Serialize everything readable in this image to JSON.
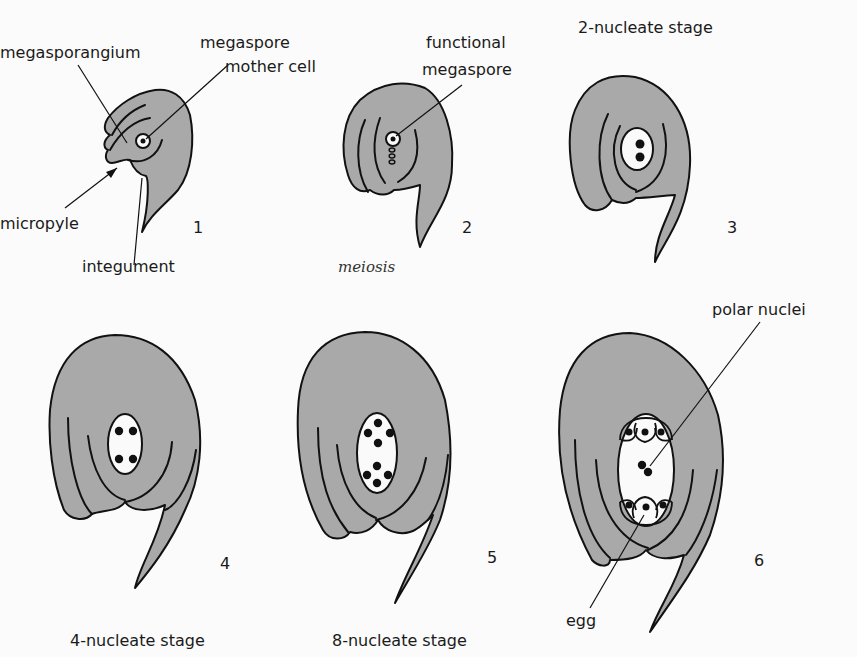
{
  "figure": {
    "colors": {
      "tissue": "#a9a9a9",
      "outline": "#111111",
      "sac": "#fafafa",
      "background": "#fbfbfb"
    },
    "panels": [
      {
        "number": "1",
        "labels": [
          "megasporangium",
          "megaspore",
          "mother cell",
          "micropyle",
          "integument"
        ]
      },
      {
        "number": "2",
        "labels": [
          "functional",
          "megaspore"
        ],
        "caption": "meiosis"
      },
      {
        "number": "3",
        "title": "2-nucleate stage"
      },
      {
        "number": "4",
        "caption": "4-nucleate stage"
      },
      {
        "number": "5",
        "caption": "8-nucleate stage"
      },
      {
        "number": "6",
        "labels": [
          "polar nuclei",
          "egg"
        ]
      }
    ]
  }
}
